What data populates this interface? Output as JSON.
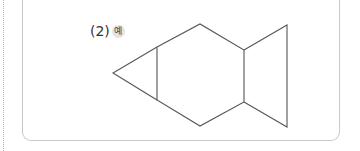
{
  "problem": {
    "number_label": "(2)",
    "badge_label": "예"
  },
  "figure": {
    "stroke_color": "#555555",
    "shapes": [
      {
        "name": "head-triangle",
        "points": "113,73 157,47 157,100"
      },
      {
        "name": "body-hexagon",
        "points": "157,47 200,24 244,50 244,102 200,126 157,100"
      },
      {
        "name": "tail-triangle",
        "points": "244,50 287,25 287,127 244,102"
      }
    ]
  },
  "colors": {
    "border": "#c9c9c9",
    "dotted_guide": "#b8b8b8",
    "badge_bg": "#e3e3e3"
  }
}
